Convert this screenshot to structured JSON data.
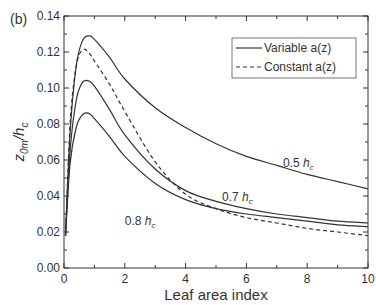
{
  "panel_label": "(b)",
  "chart_data": {
    "type": "line",
    "title": "",
    "xlabel": "Leaf area index",
    "ylabel": "z0m/hc",
    "xlim": [
      0,
      10
    ],
    "ylim": [
      0,
      0.14
    ],
    "xticks": [
      0,
      2,
      4,
      6,
      8,
      10
    ],
    "xtick_labels": [
      "0",
      "2",
      "4",
      "6",
      "8",
      "10"
    ],
    "yticks": [
      0.0,
      0.02,
      0.04,
      0.06,
      0.08,
      0.1,
      0.12,
      0.14
    ],
    "ytick_labels": [
      "0.00",
      "0.02",
      "0.04",
      "0.06",
      "0.08",
      "0.10",
      "0.12",
      "0.14"
    ],
    "grid": false,
    "legend_position": "upper right",
    "legend": [
      {
        "label": "Variable a(z)",
        "style": "solid"
      },
      {
        "label": "Constant a(z)",
        "style": "dashed"
      }
    ],
    "x": [
      0.05,
      0.2,
      0.4,
      0.6,
      0.8,
      1.0,
      1.5,
      2,
      3,
      4,
      5,
      6,
      7,
      8,
      9,
      10
    ],
    "series": [
      {
        "name": "Variable a(z), 0.5 hc",
        "style": "solid",
        "values": [
          0.018,
          0.075,
          0.112,
          0.126,
          0.129,
          0.127,
          0.117,
          0.105,
          0.089,
          0.078,
          0.069,
          0.062,
          0.057,
          0.052,
          0.048,
          0.044
        ]
      },
      {
        "name": "Variable a(z), 0.7 hc",
        "style": "solid",
        "values": [
          0.018,
          0.065,
          0.093,
          0.103,
          0.104,
          0.101,
          0.088,
          0.074,
          0.055,
          0.043,
          0.037,
          0.033,
          0.03,
          0.028,
          0.026,
          0.025
        ]
      },
      {
        "name": "Variable a(z), 0.8 hc",
        "style": "solid",
        "values": [
          0.018,
          0.058,
          0.078,
          0.085,
          0.086,
          0.083,
          0.073,
          0.062,
          0.047,
          0.038,
          0.033,
          0.03,
          0.028,
          0.026,
          0.024,
          0.023
        ]
      },
      {
        "name": "Constant a(z)",
        "style": "dashed",
        "values": [
          0.018,
          0.08,
          0.112,
          0.121,
          0.12,
          0.115,
          0.102,
          0.087,
          0.059,
          0.041,
          0.033,
          0.028,
          0.025,
          0.022,
          0.02,
          0.018
        ]
      }
    ],
    "annotations": [
      {
        "text": "0.5 h",
        "sub": "c",
        "x": 7.2,
        "y": 0.056
      },
      {
        "text": "0.7 h",
        "sub": "c",
        "x": 5.2,
        "y": 0.037
      },
      {
        "text": "0.8 h",
        "sub": "c",
        "x": 2.0,
        "y": 0.024
      }
    ]
  }
}
